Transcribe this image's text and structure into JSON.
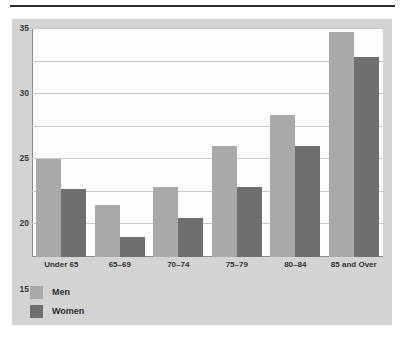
{
  "figure": {
    "background_color": "#d3d3d3",
    "plot_background_color": "#fdfdfd",
    "top_rule_color": "#2c2c2c"
  },
  "chart_data": {
    "type": "bar",
    "title": "",
    "subtitle": "",
    "xlabel": "",
    "ylabel": "",
    "categories": [
      "Under 65",
      "65–69",
      "70–74",
      "75–79",
      "80–84",
      "85 and Over"
    ],
    "series": [
      {
        "name": "Men",
        "color": "#a9a9a9",
        "values": [
          15.0,
          8.0,
          10.8,
          17.1,
          21.8,
          34.5
        ]
      },
      {
        "name": "Women",
        "color": "#6f6f6f",
        "values": [
          10.5,
          3.0,
          6.0,
          10.8,
          17.0,
          30.7
        ]
      }
    ],
    "ylim": [
      0,
      35
    ],
    "yticks": [
      0,
      5,
      10,
      15,
      20,
      25,
      30,
      35
    ],
    "ytick_labels": [
      "0",
      "5",
      "10",
      "15",
      "20",
      "25",
      "30",
      "35"
    ],
    "grid": true,
    "grid_axis": "y",
    "legend_position": "below-left",
    "legend_entries": [
      "Men",
      "Women"
    ]
  }
}
